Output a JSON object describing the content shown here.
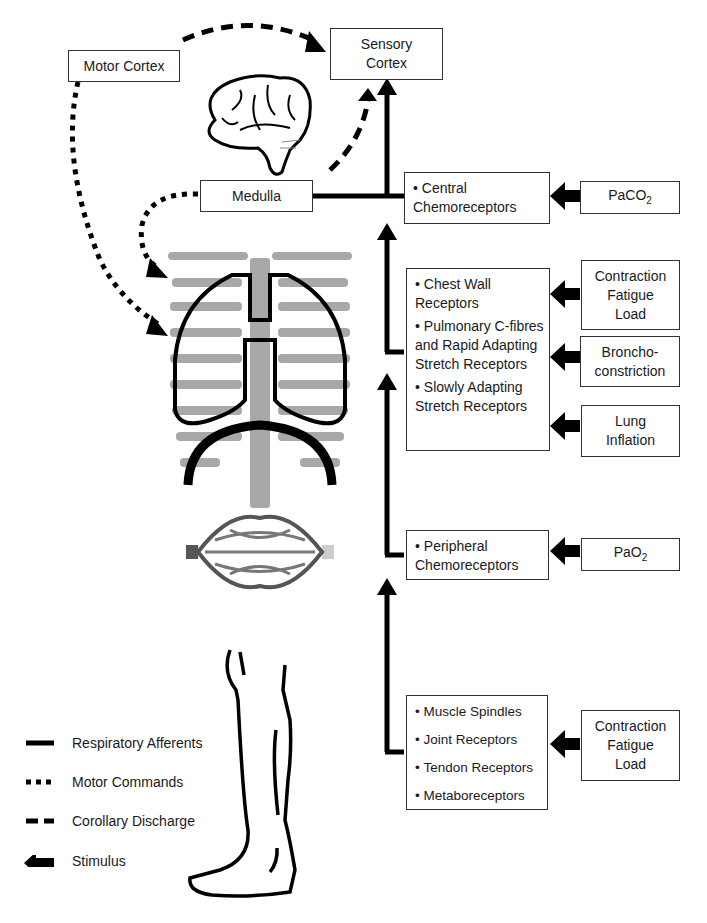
{
  "nodes": {
    "motor_cortex": "Motor Cortex",
    "sensory_cortex_line1": "Sensory",
    "sensory_cortex_line2": "Cortex",
    "medulla": "Medulla"
  },
  "receptor_groups": {
    "central": {
      "items": [
        "Central Chemoreceptors"
      ]
    },
    "thoracic": {
      "items": [
        "Chest Wall Receptors",
        "Pulmonary C-fibres and Rapid Adapting Stretch Receptors",
        "Slowly Adapting Stretch Receptors"
      ]
    },
    "peripheral": {
      "items": [
        "Peripheral Chemoreceptors"
      ]
    },
    "limb": {
      "items": [
        "Muscle Spindles",
        "Joint Receptors",
        "Tendon Receptors",
        "Metaboreceptors"
      ]
    }
  },
  "stimuli": {
    "paco2": {
      "base": "PaCO",
      "sub": "2"
    },
    "chest_wall": "Contraction\nFatigue\nLoad",
    "bronchoconstriction": "Broncho-\nconstriction",
    "lung_inflation": "Lung\nInflation",
    "pao2": {
      "base": "PaO",
      "sub": "2"
    },
    "limb": "Contraction\nFatigue\nLoad"
  },
  "legend": [
    {
      "style": "solid",
      "label": "Respiratory Afferents"
    },
    {
      "style": "dotted",
      "label": "Motor Commands"
    },
    {
      "style": "dashed",
      "label": "Corollary Discharge"
    },
    {
      "style": "arrow",
      "label": "Stimulus"
    }
  ],
  "illustrations": [
    "brain",
    "thorax-with-lungs-and-diaphragm",
    "capillary-network",
    "leg"
  ]
}
